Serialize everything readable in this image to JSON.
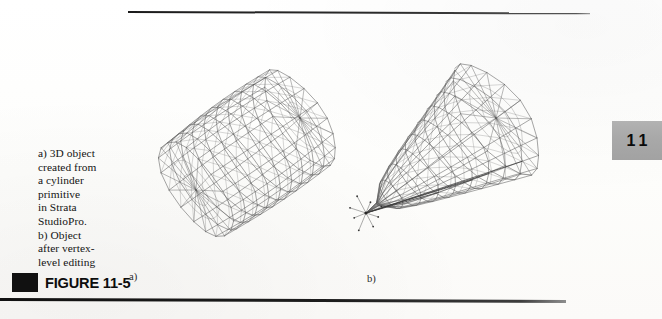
{
  "page": {
    "background_color": "#fdfdfc",
    "width": 662,
    "height": 319
  },
  "rules": {
    "top_rule_color": "#222222",
    "bottom_rule_color": "#141414"
  },
  "caption": {
    "text": "a) 3D object created from a cylinder primitive in Strata StudioPro. b) Object after vertex-level editing",
    "wrapped_lines": [
      "a) 3D object",
      "created from",
      "a cylinder",
      "primitive",
      "in Strata",
      "StudioPro.",
      "b) Object",
      "after vertex-",
      "level editing"
    ],
    "text_color": "#141414"
  },
  "figure": {
    "marker_color": "#111111",
    "title": "FIGURE 11-5",
    "sublabel_a": "a)",
    "sublabel_b": "b)"
  },
  "chapter_tab": {
    "number": "11",
    "background_color": "#a9a9a9",
    "text_color": "#0a0a0a"
  },
  "artwork": {
    "stroke_color": "#4f4f4f",
    "accent_stroke_color": "#2a2a2a",
    "panel_a": {
      "label": "a)",
      "description": "Wireframe 3D cylinder primitive created in Strata StudioPro, shown in three-quarter perspective with quad mesh bands and radial end-cap spokes.",
      "shape": "cylinder",
      "mesh_segments_around": 18,
      "mesh_segments_along": 9
    },
    "panel_b": {
      "label": "b)",
      "description": "Same cylinder after vertex-level editing: the near-left end cap has been collapsed and pulled to a single pinched point, tapering the body into a horn-like form; editing handles radiate from the selected vertex.",
      "shape": "tapered-pinched-cylinder",
      "mesh_segments_around": 18,
      "mesh_segments_along": 9,
      "selected_vertex_handles": 8
    }
  }
}
